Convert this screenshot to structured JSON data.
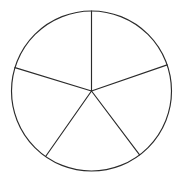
{
  "figure": {
    "background_color": "#ffffff",
    "stroke_color": "#2b2b2b",
    "fill_color": "#ffffff",
    "stroke_width": 1.15
  },
  "chart_data": {
    "type": "pie",
    "xlabel": "",
    "ylabel": "",
    "grid": false,
    "legend": false,
    "legend_position": "none",
    "labels_shown": false,
    "categories": [
      "Sector 1",
      "Sector 2",
      "Sector 3",
      "Sector 4",
      "Sector 5"
    ],
    "values": [
      71,
      72,
      72,
      72,
      73
    ],
    "value_unit": "degrees",
    "slice_count": 5,
    "total_degrees": 360,
    "colors": [
      "#ffffff",
      "#ffffff",
      "#ffffff",
      "#ffffff",
      "#ffffff"
    ],
    "edge_color": "#2b2b2b",
    "center": {
      "x": 91.5,
      "y": 91.0
    },
    "radius": 80.0,
    "boundary_angles_deg": [
      -90,
      -19,
      53,
      125,
      -163
    ],
    "slices": [
      {
        "name": "Sector 1",
        "start_angle_deg": -90,
        "end_angle_deg": -19,
        "sweep_deg": 71,
        "fill": "#ffffff"
      },
      {
        "name": "Sector 2",
        "start_angle_deg": -19,
        "end_angle_deg": 53,
        "sweep_deg": 72,
        "fill": "#ffffff"
      },
      {
        "name": "Sector 3",
        "start_angle_deg": 53,
        "end_angle_deg": 125,
        "sweep_deg": 72,
        "fill": "#ffffff"
      },
      {
        "name": "Sector 4",
        "start_angle_deg": 125,
        "end_angle_deg": 197,
        "sweep_deg": 72,
        "fill": "#ffffff"
      },
      {
        "name": "Sector 5",
        "start_angle_deg": 197,
        "end_angle_deg": 270,
        "sweep_deg": 73,
        "fill": "#ffffff"
      }
    ],
    "spokes": [
      {
        "name": "spoke-top",
        "angle_deg": -90,
        "x2": 91.5,
        "y2": 11.0
      },
      {
        "name": "spoke-upper-right",
        "angle_deg": -19,
        "x2": 167.2,
        "y2": 64.9
      },
      {
        "name": "spoke-lower-right",
        "angle_deg": 53,
        "x2": 139.6,
        "y2": 154.9
      },
      {
        "name": "spoke-lower-left",
        "angle_deg": 125,
        "x2": 45.6,
        "y2": 156.5
      },
      {
        "name": "spoke-upper-left",
        "angle_deg": 197,
        "x2": 15.0,
        "y2": 67.6
      }
    ]
  }
}
